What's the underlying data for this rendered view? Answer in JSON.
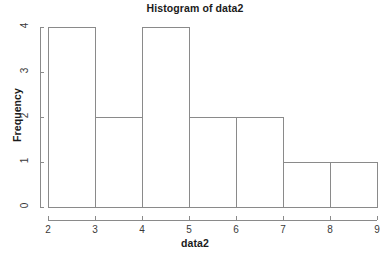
{
  "chart_data": {
    "type": "bar",
    "title": "Histogram of data2",
    "xlabel": "data2",
    "ylabel": "Frequency",
    "bin_edges": [
      2,
      3,
      4,
      5,
      6,
      7,
      8,
      9
    ],
    "categories": [
      "2-3",
      "3-4",
      "4-5",
      "5-6",
      "6-7",
      "7-8",
      "8-9"
    ],
    "values": [
      4,
      2,
      4,
      2,
      2,
      1,
      1
    ],
    "xlim": [
      2,
      9
    ],
    "ylim": [
      0,
      4
    ],
    "xticks": [
      "2",
      "3",
      "4",
      "5",
      "6",
      "7",
      "8",
      "9"
    ],
    "yticks": [
      "0",
      "1",
      "2",
      "3",
      "4"
    ],
    "grid": false,
    "legend": null,
    "bar_fill": "#ffffff",
    "bar_border": "#8a8a8a",
    "axis_color": "#8a8a8a",
    "text_color": "#1b1b1b",
    "background": "#ffffff"
  }
}
